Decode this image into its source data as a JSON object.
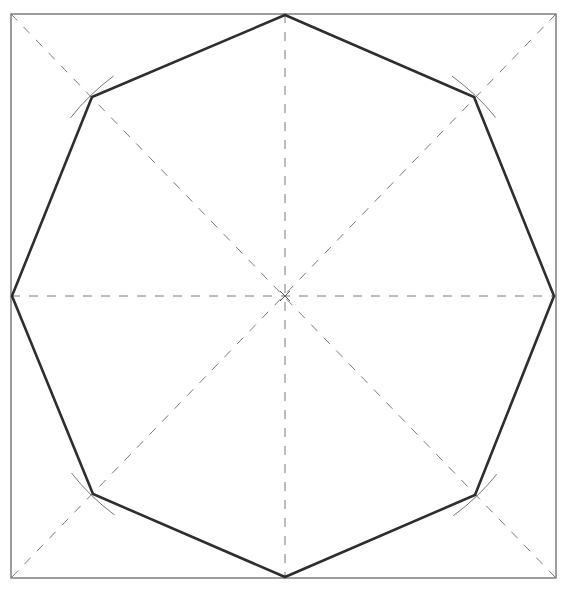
{
  "diagram": {
    "colors": {
      "background": "#ffffff",
      "square": "#6a6a6a",
      "construction_lines": "#7a7a7a",
      "octagon": "#2e2e2e",
      "arcs": "#777777"
    },
    "square": {
      "x1": 11,
      "y1": 14,
      "x2": 556,
      "y2": 578
    },
    "center": {
      "x": 285,
      "y": 296
    },
    "construction_lines": [
      {
        "name": "vertical-centerline",
        "x1": 285,
        "y1": 14,
        "x2": 285,
        "y2": 578
      },
      {
        "name": "horizontal-centerline",
        "x1": 11,
        "y1": 296,
        "x2": 556,
        "y2": 296
      },
      {
        "name": "diagonal-tl-br",
        "x1": 11,
        "y1": 14,
        "x2": 556,
        "y2": 578
      },
      {
        "name": "diagonal-tr-bl",
        "x1": 556,
        "y1": 14,
        "x2": 11,
        "y2": 578
      }
    ],
    "octagon_vertices": [
      {
        "name": "top",
        "x": 285,
        "y": 15
      },
      {
        "name": "top-right",
        "x": 474,
        "y": 97
      },
      {
        "name": "right",
        "x": 554,
        "y": 296
      },
      {
        "name": "bottom-right",
        "x": 475,
        "y": 495
      },
      {
        "name": "bottom",
        "x": 285,
        "y": 577
      },
      {
        "name": "bottom-left",
        "x": 93,
        "y": 494
      },
      {
        "name": "left",
        "x": 12,
        "y": 296
      },
      {
        "name": "top-left",
        "x": 92,
        "y": 97
      }
    ],
    "compass_arcs": [
      {
        "name": "arc-top-left",
        "cx": 92,
        "cy": 97
      },
      {
        "name": "arc-top-right",
        "cx": 474,
        "cy": 97
      },
      {
        "name": "arc-bottom-left",
        "cx": 93,
        "cy": 494
      },
      {
        "name": "arc-bottom-right",
        "cx": 475,
        "cy": 495
      }
    ]
  }
}
